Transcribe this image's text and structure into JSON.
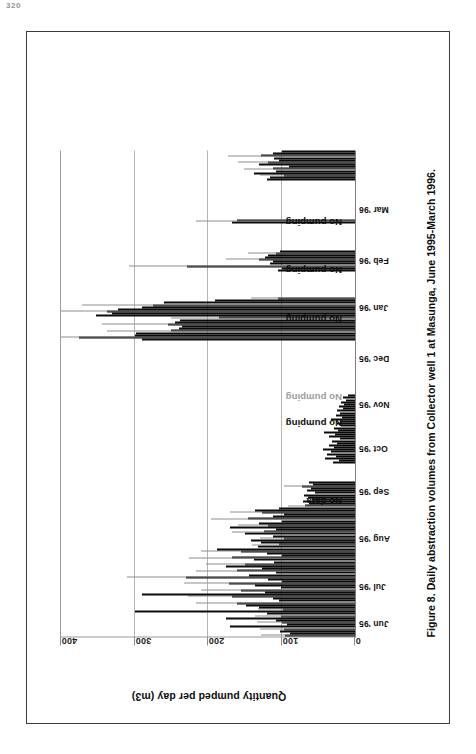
{
  "page": {
    "header_mark": "320"
  },
  "figure": {
    "caption": "Figure 8. Daily abstraction volumes from Collector well 1 at Masunga, June 1995-March 1996."
  },
  "chart_data": {
    "type": "bar",
    "title": "",
    "xlabel": "",
    "ylabel": "Quantity pumped per day (m3)",
    "ylim": [
      0,
      400
    ],
    "yticks": [
      0,
      100,
      200,
      300,
      400
    ],
    "ytick_labels": [
      "0",
      "100",
      "200",
      "300",
      "400"
    ],
    "grid": true,
    "grid_axis": "y",
    "legend": "none",
    "orientation": "rotated-90-on-page",
    "x_tick_labels": [
      "Jun '95",
      "Jul '95",
      "Aug '95",
      "Sep '95",
      "Oct '95",
      "Nov '95",
      "Dec '95",
      "Jan '96",
      "Feb '96",
      "Mar '96"
    ],
    "x_tick_positions_pct": [
      0.5,
      8.0,
      18.0,
      27.5,
      36.5,
      45.5,
      55.0,
      65.5,
      75.0,
      85.5
    ],
    "annotations": [
      {
        "text": "No data",
        "x_pct": 29.0,
        "y_value": 18,
        "style": "dark"
      },
      {
        "text": "No pumping",
        "x_pct": 45.0,
        "y_value": 18,
        "style": "dark"
      },
      {
        "text": "No pumping",
        "x_pct": 50.5,
        "y_value": 18,
        "style": "ghost"
      },
      {
        "text": "No pumping",
        "x_pct": 66.5,
        "y_value": 18,
        "style": "dark"
      },
      {
        "text": "No pumping",
        "x_pct": 76.5,
        "y_value": 18,
        "style": "dark"
      },
      {
        "text": "No pumping",
        "x_pct": 86.5,
        "y_value": 18,
        "style": "dark"
      }
    ],
    "note": "Daily values; x is day-of-record from June 1995 to March 1996. Gaps are periods labelled 'No data' or 'No pumping'.",
    "values": [
      95,
      88,
      102,
      96,
      170,
      92,
      99,
      108,
      175,
      101,
      120,
      300,
      98,
      130,
      148,
      160,
      104,
      112,
      168,
      290,
      122,
      155,
      101,
      136,
      172,
      99,
      118,
      230,
      144,
      108,
      160,
      126,
      175,
      150,
      110,
      138,
      167,
      100,
      120,
      155,
      188,
      132,
      104,
      128,
      141,
      96,
      112,
      150,
      124,
      108,
      170,
      118,
      131,
      100,
      145,
      112,
      97,
      126,
      136,
      104,
      68,
      62,
      71,
      58,
      64,
      69,
      55,
      66,
      60,
      72,
      57,
      63,
      0,
      0,
      0,
      0,
      0,
      0,
      0,
      0,
      30,
      22,
      41,
      26,
      38,
      33,
      44,
      29,
      36,
      24,
      31,
      20,
      35,
      27,
      42,
      23,
      28,
      19,
      25,
      21,
      32,
      18,
      26,
      20,
      24,
      17,
      22,
      15,
      19,
      12,
      16,
      10,
      0,
      0,
      0,
      0,
      0,
      0,
      0,
      0,
      0,
      0,
      0,
      0,
      0,
      0,
      0,
      0,
      0,
      0,
      0,
      0,
      0,
      0,
      0,
      0,
      0,
      290,
      375,
      300,
      298,
      250,
      240,
      235,
      255,
      245,
      238,
      185,
      352,
      330,
      338,
      322,
      290,
      275,
      260,
      190,
      105,
      0,
      0,
      0,
      0,
      0,
      0,
      0,
      0,
      0,
      0,
      0,
      0,
      105,
      100,
      228,
      115,
      112,
      130,
      122,
      118,
      108,
      102,
      0,
      0,
      0,
      0,
      0,
      0,
      0,
      0,
      0,
      0,
      0,
      0,
      168,
      160,
      0,
      0,
      0,
      0,
      0,
      0,
      0,
      0,
      0,
      0,
      0,
      0,
      0,
      0,
      0,
      0,
      0,
      0,
      120,
      115,
      96,
      138,
      108,
      112,
      90,
      130,
      118,
      104,
      110,
      128,
      112,
      100
    ],
    "series_groups": [
      {
        "name": "Jun-Jul 1995",
        "range_pct": [
          0.5,
          17.0
        ],
        "peak": 300,
        "typical": 130
      },
      {
        "name": "Aug 1995",
        "range_pct": [
          17.5,
          24.0
        ],
        "peak": 72,
        "typical": 64
      },
      {
        "name": "Sep 1995",
        "range_pct": [
          27.0,
          33.0
        ],
        "peak": 44,
        "typical": 30,
        "label": "No data"
      },
      {
        "name": "Oct 1995",
        "range_pct": [
          33.5,
          40.0
        ],
        "peak": 32,
        "typical": 21
      },
      {
        "name": "Nov 1995",
        "range_pct": [
          42.0,
          52.0
        ],
        "peak": 0,
        "typical": 0,
        "label": "No pumping"
      },
      {
        "name": "Dec 1995",
        "range_pct": [
          53.0,
          62.0
        ],
        "peak": 375,
        "typical": 280
      },
      {
        "name": "Jan 1996",
        "range_pct": [
          64.0,
          71.0
        ],
        "peak": 228,
        "typical": 114,
        "label": "No pumping"
      },
      {
        "name": "Feb 1996",
        "range_pct": [
          74.0,
          80.0
        ],
        "peak": 168,
        "typical": 0,
        "label": "No pumping"
      },
      {
        "name": "Mar 1996",
        "range_pct": [
          84.0,
          93.0
        ],
        "peak": 138,
        "typical": 113,
        "label": "No pumping"
      }
    ]
  }
}
